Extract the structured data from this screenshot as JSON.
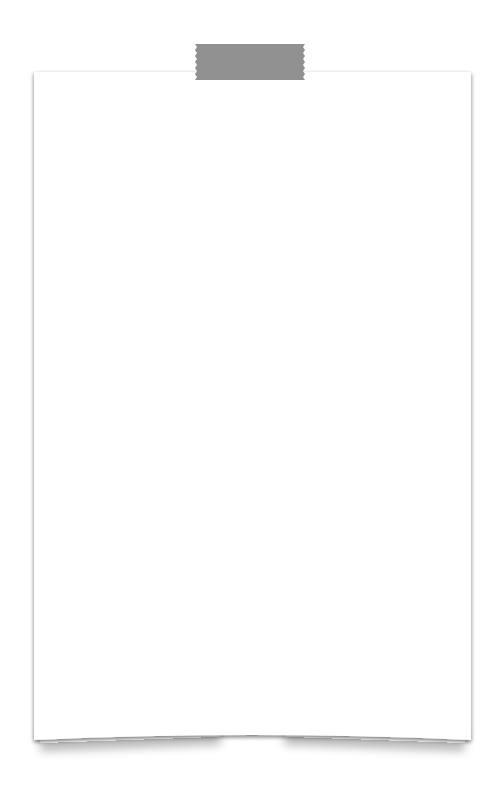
{
  "note": {
    "paper_color": "#ffffff",
    "edge_shadow_color": "#9a9a9a",
    "text": ""
  },
  "tape": {
    "color": "#8b8b8b",
    "icon": "washi-tape"
  }
}
